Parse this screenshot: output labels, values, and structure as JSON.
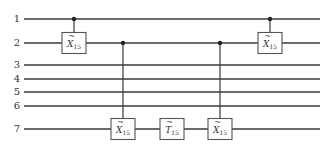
{
  "diagram": {
    "type": "quantum-circuit",
    "colors": {
      "wire": "#3a3a3a",
      "gate_border": "#555555",
      "background": "#ffffff"
    },
    "qubits": [
      {
        "label": "1",
        "y": 19
      },
      {
        "label": "2",
        "y": 43
      },
      {
        "label": "3",
        "y": 65
      },
      {
        "label": "4",
        "y": 79
      },
      {
        "label": "5",
        "y": 92
      },
      {
        "label": "6",
        "y": 106
      },
      {
        "label": "7",
        "y": 129
      }
    ],
    "wire_x_start": 24,
    "wire_x_end": 320,
    "gates": [
      {
        "name": "X",
        "accent": "~",
        "subscript": "15",
        "target": 2,
        "control": 1,
        "x": 74
      },
      {
        "name": "X",
        "accent": "~",
        "subscript": "15",
        "target": 7,
        "control": 2,
        "x": 123
      },
      {
        "name": "T",
        "accent": "~",
        "subscript": "15",
        "target": 7,
        "control": null,
        "x": 172
      },
      {
        "name": "X",
        "accent": "~",
        "subscript": "15",
        "target": 7,
        "control": 2,
        "x": 220
      },
      {
        "name": "X",
        "accent": "~",
        "subscript": "15",
        "target": 2,
        "control": 1,
        "x": 270
      }
    ]
  }
}
